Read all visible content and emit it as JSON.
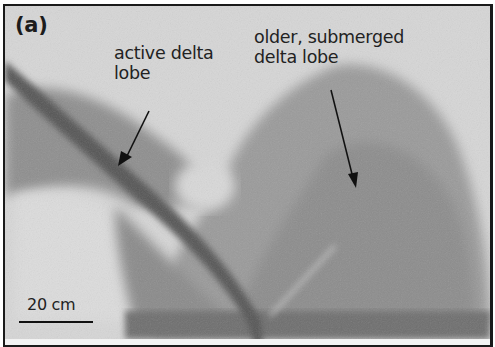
{
  "figure": {
    "panel_label": "(a)",
    "annotations": [
      {
        "id": "active",
        "line1": "active delta",
        "line2": "lobe"
      },
      {
        "id": "older",
        "line1": "older, submerged",
        "line2": "delta lobe"
      }
    ],
    "scale_bar": {
      "label": "20 cm"
    },
    "colors": {
      "frame": "#1a1a1a",
      "background": "#d4d4d4",
      "channel": "#5a5a5a",
      "lobe": "#8a8a8a"
    }
  }
}
